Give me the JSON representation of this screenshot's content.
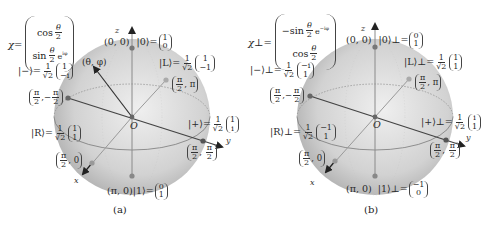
{
  "panels": [
    {
      "id": "a",
      "caption": "(a)",
      "spinor": {
        "symbol": "χ",
        "equals": "=",
        "top": {
          "fn": "cos",
          "num": "θ",
          "den": "2",
          "extra": ""
        },
        "bottom": {
          "fn": "sin",
          "num": "θ",
          "den": "2",
          "extra": "e^{iφ}",
          "extra_display": "e",
          "extra_sup": "iφ"
        }
      },
      "axes": {
        "x": "x",
        "y": "y",
        "z": "z",
        "origin": "O"
      },
      "states": {
        "zero": {
          "coord": "(0, 0)",
          "ket": "|0⟩",
          "eq": "=",
          "vec": [
            "1",
            "0"
          ]
        },
        "one": {
          "coord": "(π, 0)",
          "ket": "|1⟩",
          "eq": "=",
          "vec": [
            "0",
            "1"
          ]
        },
        "minus": {
          "ket": "|−⟩",
          "eq": "=",
          "frac_num": "1",
          "frac_den": "√2",
          "vec": [
            "1",
            "−i"
          ],
          "coord_num": "π",
          "coord_den": "2",
          "coord_second": "−π/2",
          "coord_second_num": "π",
          "coord_second_den": "2",
          "coord_second_sign": "−"
        },
        "plus": {
          "ket": "|+⟩",
          "eq": "=",
          "frac_num": "1",
          "frac_den": "√2",
          "vec": [
            "1",
            "i"
          ],
          "coord_num": "π",
          "coord_den": "2",
          "coord_second_num": "π",
          "coord_second_den": "2"
        },
        "L": {
          "ket": "|L⟩",
          "eq": "=",
          "frac_num": "1",
          "frac_den": "√2",
          "vec": [
            "1",
            "−1"
          ],
          "coord_num": "π",
          "coord_den": "2",
          "coord_second": "π"
        },
        "R": {
          "ket": "|R⟩",
          "eq": "=",
          "frac_num": "1",
          "frac_den": "√2",
          "vec": [
            "1",
            "1"
          ],
          "coord_num": "π",
          "coord_den": "2",
          "coord_second": "0"
        }
      },
      "general_point": "(θ, φ)"
    },
    {
      "id": "b",
      "caption": "(b)",
      "spinor": {
        "symbol": "χ⊥",
        "equals": "=",
        "top": {
          "fn": "−sin",
          "num": "θ",
          "den": "2",
          "extra": "e^{−iφ}",
          "extra_display": "e",
          "extra_sup": "−iφ"
        },
        "bottom": {
          "fn": "cos",
          "num": "θ",
          "den": "2",
          "extra": ""
        }
      },
      "axes": {
        "x": "x",
        "y": "y",
        "z": "z",
        "origin": "O"
      },
      "states": {
        "zero": {
          "coord": "(0, 0)",
          "ket": "|0⟩⊥",
          "eq": "=",
          "vec": [
            "0",
            "1"
          ]
        },
        "one": {
          "coord": "(π, 0)",
          "ket": "|1⟩⊥",
          "eq": "=",
          "vec": [
            "−1",
            "0"
          ]
        },
        "minus": {
          "ket": "|−⟩⊥",
          "eq": "=",
          "frac_num": "1",
          "frac_den": "√2",
          "vec": [
            "−i",
            "1"
          ],
          "coord_num": "π",
          "coord_den": "2",
          "coord_second_num": "π",
          "coord_second_den": "2",
          "coord_second_sign": "−"
        },
        "plus": {
          "ket": "|+⟩⊥",
          "eq": "=",
          "frac_num": "1",
          "frac_den": "√2",
          "vec": [
            "i",
            "1"
          ],
          "coord_num": "π",
          "coord_den": "2",
          "coord_second_num": "π",
          "coord_second_den": "2"
        },
        "L": {
          "ket": "|L⟩⊥",
          "eq": "=",
          "frac_num": "1",
          "frac_den": "√2",
          "vec": [
            "1",
            "1"
          ],
          "coord_num": "π",
          "coord_den": "2",
          "coord_second": "π"
        },
        "R": {
          "ket": "|R⟩⊥",
          "eq": "=",
          "frac_num": "1",
          "frac_den": "√2",
          "vec": [
            "−1",
            "1"
          ],
          "coord_num": "π",
          "coord_den": "2",
          "coord_second": "0"
        }
      }
    }
  ],
  "colors": {
    "sphere_fill_center": "#eeeeee",
    "sphere_fill_edge": "#b4b4b4",
    "axis_dark": "#333333",
    "axis_light": "#8a8a8a",
    "dot_dark": "#6a6a6a",
    "dot_light": "#a8a8a8",
    "equator": "#7a7a7a"
  }
}
